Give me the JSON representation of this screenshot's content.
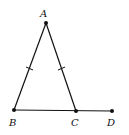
{
  "diagram": {
    "type": "geometry",
    "points": {
      "A": {
        "label": "A",
        "x": 46,
        "y": 23
      },
      "B": {
        "label": "B",
        "x": 14,
        "y": 110
      },
      "C": {
        "label": "C",
        "x": 76,
        "y": 111
      },
      "D": {
        "label": "D",
        "x": 112,
        "y": 111
      }
    },
    "segments": [
      "AB",
      "AC",
      "BD"
    ],
    "congruent_marks": [
      "AB",
      "AC"
    ],
    "colors": {
      "stroke": "#111111",
      "background": "#ffffff"
    }
  }
}
